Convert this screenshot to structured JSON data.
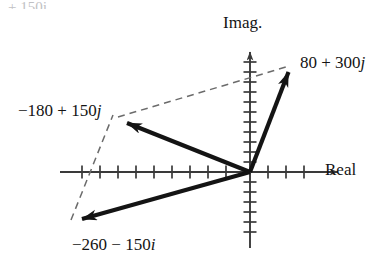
{
  "figure": {
    "title_cropped": "+ 150j",
    "axes": {
      "imag_label": "Imag.",
      "real_label": "Real",
      "origin_px": [
        250,
        172
      ],
      "tick_spacing_px": 18,
      "real_axis_px": [
        60,
        345
      ],
      "imag_axis_px": [
        48,
        248
      ],
      "ticks_left": 10,
      "ticks_right": 3,
      "ticks_up": 12,
      "ticks_down": 6
    },
    "vectors": [
      {
        "id": "v-sum",
        "label": "80 + 300j",
        "label_real": "80",
        "label_op": "+",
        "label_imag": "300",
        "unit": "j",
        "style": "solid",
        "tip_px": [
          291,
          65
        ],
        "tail_px": [
          250,
          172
        ]
      },
      {
        "id": "v-a",
        "label": "−180 + 150j",
        "label_real": "−180",
        "label_op": "+",
        "label_imag": "150",
        "unit": "j",
        "style": "solid",
        "tip_px": [
          114,
          118
        ],
        "tail_px": [
          250,
          172
        ]
      },
      {
        "id": "v-b",
        "label": "−260 − 150i",
        "label_real": "−260",
        "label_op": "−",
        "label_imag": "150",
        "unit": "i",
        "style": "solid",
        "tip_px": [
          68,
          223
        ],
        "tail_px": [
          250,
          172
        ]
      }
    ],
    "construction_lines": [
      {
        "id": "dash-a-to-sum",
        "style": "dashed",
        "from_px": [
          114,
          118
        ],
        "to_px": [
          291,
          65
        ]
      },
      {
        "id": "dash-b-to-a",
        "style": "dashed",
        "from_px": [
          68,
          223
        ],
        "to_px": [
          114,
          118
        ]
      }
    ],
    "colors": {
      "ink": "#141414",
      "axis": "#4a4a4a",
      "dash": "#6b6b6b",
      "background": "#ffffff"
    }
  }
}
